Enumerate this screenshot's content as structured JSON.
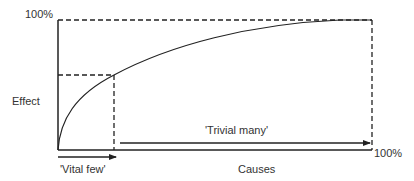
{
  "labels": {
    "y_top": "100%",
    "y_axis": "Effect",
    "x_axis": "Causes",
    "x_right": "100%",
    "vital_few": "'Vital few'",
    "trivial_many": "'Trivial many'"
  },
  "colors": {
    "line": "#222222",
    "text": "#333333",
    "background": "#ffffff"
  },
  "geometry": {
    "origin": [
      58,
      150
    ],
    "top_right": [
      372,
      20
    ],
    "breakpoint": [
      114,
      75
    ]
  }
}
